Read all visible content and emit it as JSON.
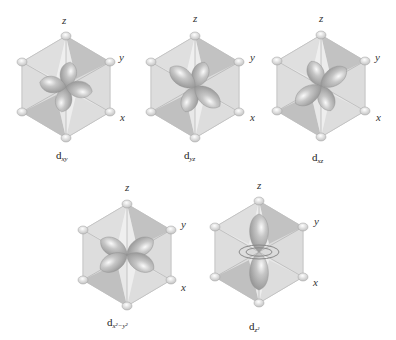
{
  "figure": {
    "type": "d-orbital-octahedral-diagrams",
    "colors": {
      "face_dark": "#c4c4c4",
      "face_light": "#e2e2e2",
      "face_lightest": "#f1f1f1",
      "edge": "#b9b9b9",
      "axis_line": "#a8a8a8",
      "ligand": "#e6e6e6",
      "ligand_stroke": "#9a9a9a",
      "lobe": "#9e9e9e",
      "lobe_highlight": "#f4f4f4",
      "text": "#333333"
    }
  },
  "panels": [
    {
      "id": "dxy",
      "label_main": "d",
      "label_sub": "xy",
      "axes": {
        "z": "z",
        "y": "y",
        "x": "x"
      }
    },
    {
      "id": "dyz",
      "label_main": "d",
      "label_sub": "yz",
      "axes": {
        "z": "z",
        "y": "y",
        "x": "x"
      }
    },
    {
      "id": "dxz",
      "label_main": "d",
      "label_sub": "xz",
      "axes": {
        "z": "z",
        "y": "y",
        "x": "x"
      }
    },
    {
      "id": "dx2y2",
      "label_main": "d",
      "label_sub": "x²−y²",
      "axes": {
        "z": "z",
        "y": "y",
        "x": "x"
      }
    },
    {
      "id": "dz2",
      "label_main": "d",
      "label_sub": "z²",
      "axes": {
        "z": "z",
        "y": "y",
        "x": "x"
      }
    }
  ]
}
